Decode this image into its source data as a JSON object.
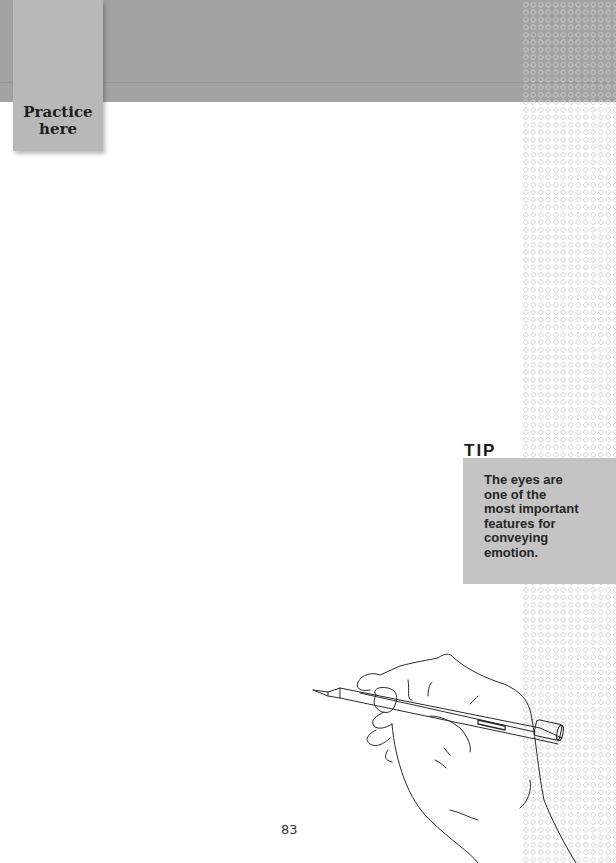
{
  "header": {
    "tab_label": "Practice\nhere",
    "band_color": "#a3a3a3",
    "tab_color": "#b8b8b8"
  },
  "tip": {
    "heading": "TIP",
    "text": "The eyes are\none of the\nmost important\nfeatures for\nconveying\nemotion.",
    "box_color": "#c4c4c4"
  },
  "illustration": {
    "icon": "hand-holding-pencil-icon"
  },
  "footer": {
    "page_number": "83"
  }
}
